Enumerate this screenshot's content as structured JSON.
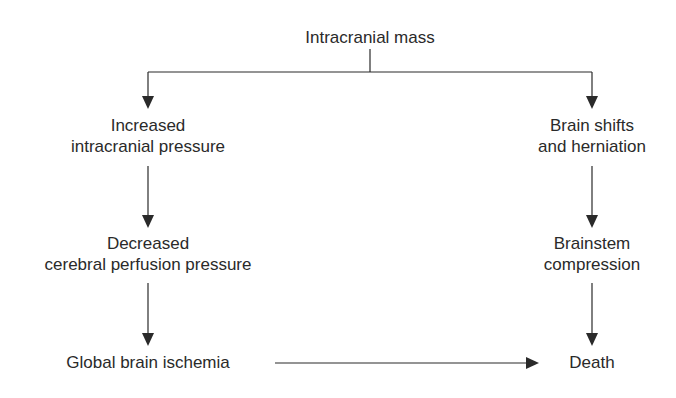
{
  "diagram": {
    "root": {
      "label": "Intracranial mass"
    },
    "left_branch": [
      {
        "lines": [
          "Increased",
          "intracranial pressure"
        ]
      },
      {
        "lines": [
          "Decreased",
          "cerebral perfusion pressure"
        ]
      },
      {
        "lines": [
          "Global brain ischemia"
        ]
      }
    ],
    "right_branch": [
      {
        "lines": [
          "Brain shifts",
          "and herniation"
        ]
      },
      {
        "lines": [
          "Brainstem",
          "compression"
        ]
      },
      {
        "lines": [
          "Death"
        ]
      }
    ],
    "edges": [
      {
        "from": "Intracranial mass",
        "to": "Increased intracranial pressure"
      },
      {
        "from": "Intracranial mass",
        "to": "Brain shifts and herniation"
      },
      {
        "from": "Increased intracranial pressure",
        "to": "Decreased cerebral perfusion pressure"
      },
      {
        "from": "Decreased cerebral perfusion pressure",
        "to": "Global brain ischemia"
      },
      {
        "from": "Brain shifts and herniation",
        "to": "Brainstem compression"
      },
      {
        "from": "Brainstem compression",
        "to": "Death"
      },
      {
        "from": "Global brain ischemia",
        "to": "Death"
      }
    ],
    "colors": {
      "line": "#2a2a2a",
      "text": "#2a2a2a",
      "background": "#ffffff"
    }
  }
}
